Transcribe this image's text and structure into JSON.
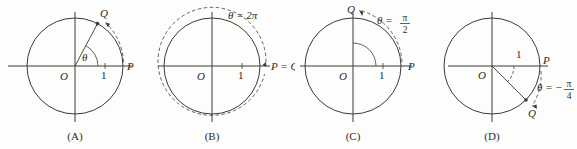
{
  "figure": {
    "background": "#fdfdfb",
    "ink": "#3a3a3a",
    "panel_count": 4
  },
  "panels": [
    {
      "caption": "(A)",
      "origin_label": "O",
      "radius_label": "1",
      "point_p": "P",
      "point_q": "Q",
      "angle_label": "θ",
      "angle_value_text": "θ",
      "angle_degrees": 62,
      "arc_direction": "counterclockwise",
      "circle_style": "solid",
      "q_equals_p": false
    },
    {
      "caption": "(B)",
      "origin_label": "O",
      "radius_label": "1",
      "point_p": "P",
      "point_q": "Q",
      "pq_label": "P = Q",
      "angle_label": "θ",
      "angle_value_text": "θ = 2π",
      "angle_degrees": 360,
      "arc_direction": "counterclockwise",
      "circle_style": "solid-with-dashed-outer",
      "q_equals_p": true
    },
    {
      "caption": "(C)",
      "origin_label": "O",
      "radius_label": "1",
      "point_p": "P",
      "point_q": "Q",
      "angle_label": "θ",
      "angle_equals": "θ =",
      "angle_numerator": "π",
      "angle_denominator": "2",
      "angle_degrees": 90,
      "arc_direction": "counterclockwise",
      "circle_style": "solid",
      "q_equals_p": false
    },
    {
      "caption": "(D)",
      "origin_label": "O",
      "radius_label": "1",
      "point_p": "P",
      "point_q": "Q",
      "angle_label": "θ",
      "angle_equals": "θ = −",
      "angle_numerator": "π",
      "angle_denominator": "4",
      "angle_degrees": -45,
      "arc_direction": "clockwise",
      "circle_style": "solid",
      "q_equals_p": false
    }
  ]
}
